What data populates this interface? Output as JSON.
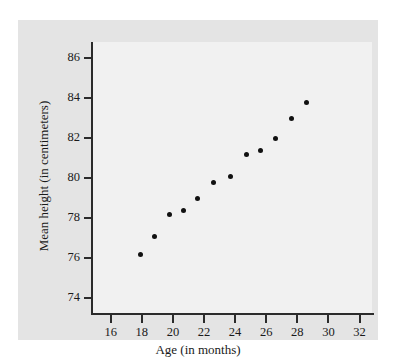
{
  "chart_data": {
    "type": "scatter",
    "title": "",
    "xlabel": "Age (in months)",
    "ylabel": "Mean height (in centimeters)",
    "xlim": [
      14.8,
      32.8
    ],
    "ylim": [
      73.2,
      86.8
    ],
    "xticks": [
      16,
      18,
      20,
      22,
      24,
      26,
      28,
      30,
      32
    ],
    "yticks": [
      74,
      76,
      78,
      80,
      82,
      84,
      86
    ],
    "grid": false,
    "legend": null,
    "marker_color": "#111111",
    "plot_bg": "#f1f1f1",
    "figure_bg": "#e4e4e4",
    "axis_color": "#2b2b2b",
    "x": [
      17.9,
      18.8,
      19.8,
      20.7,
      21.6,
      22.6,
      23.7,
      24.7,
      25.6,
      26.6,
      27.6,
      28.6
    ],
    "y": [
      76.2,
      77.1,
      78.2,
      78.4,
      79.0,
      79.8,
      80.1,
      81.2,
      81.4,
      82.0,
      83.0,
      83.8
    ],
    "points": [
      {
        "x": 17.9,
        "y": 76.2
      },
      {
        "x": 18.8,
        "y": 77.1
      },
      {
        "x": 19.8,
        "y": 78.2
      },
      {
        "x": 20.7,
        "y": 78.4
      },
      {
        "x": 21.6,
        "y": 79.0
      },
      {
        "x": 22.6,
        "y": 79.8
      },
      {
        "x": 23.7,
        "y": 80.1
      },
      {
        "x": 24.7,
        "y": 81.2
      },
      {
        "x": 25.6,
        "y": 81.4
      },
      {
        "x": 26.6,
        "y": 82.0
      },
      {
        "x": 27.6,
        "y": 83.0
      },
      {
        "x": 28.6,
        "y": 83.8
      }
    ]
  }
}
